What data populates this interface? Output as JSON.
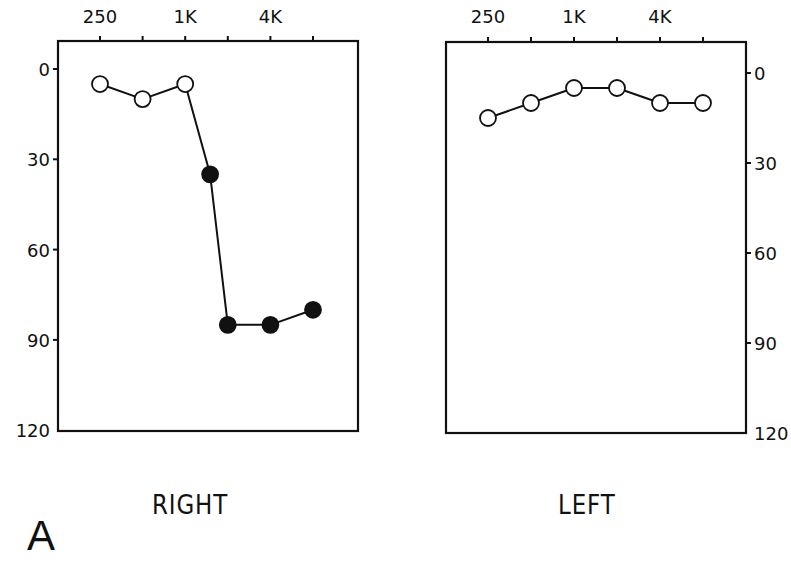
{
  "figure": {
    "panel_letter": "A",
    "caption_visible": false
  },
  "panels": [
    {
      "id": "right",
      "label": "RIGHT",
      "x_tick_labels": [
        "250",
        "1K",
        "4K"
      ],
      "y_tick_labels": [
        "0",
        "30",
        "60",
        "90",
        "120"
      ],
      "y_axis_side": "left"
    },
    {
      "id": "left",
      "label": "LEFT",
      "x_tick_labels": [
        "250",
        "1K",
        "4K"
      ],
      "y_tick_labels": [
        "0",
        "30",
        "60",
        "90",
        "120"
      ],
      "y_axis_side": "right"
    }
  ],
  "colors": {
    "line": "#111111",
    "marker_open_fill": "#ffffff",
    "marker_filled": "#111111",
    "background": "#ffffff"
  },
  "chart_data": [
    {
      "type": "line",
      "title": "RIGHT",
      "xlabel": "Frequency (Hz)",
      "ylabel": "Hearing threshold (dB)",
      "x_scale": "log2",
      "x_ticks": [
        250,
        500,
        1000,
        2000,
        4000,
        8000
      ],
      "x_tick_labels": [
        "250",
        "",
        "1K",
        "",
        "4K",
        ""
      ],
      "x_axis_position": "top",
      "y_axis_position": "left",
      "ylim": [
        120,
        -10
      ],
      "y_ticks": [
        0,
        30,
        60,
        90,
        120
      ],
      "y_inverted": true,
      "grid": false,
      "series": [
        {
          "name": "Right ear",
          "x": [
            250,
            500,
            1000,
            1500,
            2000,
            4000,
            8000
          ],
          "values": [
            5,
            10,
            5,
            35,
            85,
            85,
            80
          ],
          "marker_fill": [
            "open",
            "open",
            "open",
            "filled",
            "filled",
            "filled",
            "filled"
          ]
        }
      ]
    },
    {
      "type": "line",
      "title": "LEFT",
      "xlabel": "Frequency (Hz)",
      "ylabel": "Hearing threshold (dB)",
      "x_scale": "log2",
      "x_ticks": [
        250,
        500,
        1000,
        2000,
        4000,
        8000
      ],
      "x_tick_labels": [
        "250",
        "",
        "1K",
        "",
        "4K",
        ""
      ],
      "x_axis_position": "top",
      "y_axis_position": "right",
      "ylim": [
        120,
        -10
      ],
      "y_ticks": [
        0,
        30,
        60,
        90,
        120
      ],
      "y_inverted": true,
      "grid": false,
      "series": [
        {
          "name": "Left ear",
          "x": [
            250,
            500,
            1000,
            2000,
            4000,
            8000
          ],
          "values": [
            15,
            10,
            5,
            5,
            10,
            10
          ],
          "marker_fill": [
            "open",
            "open",
            "open",
            "open",
            "open",
            "open"
          ]
        }
      ]
    }
  ]
}
